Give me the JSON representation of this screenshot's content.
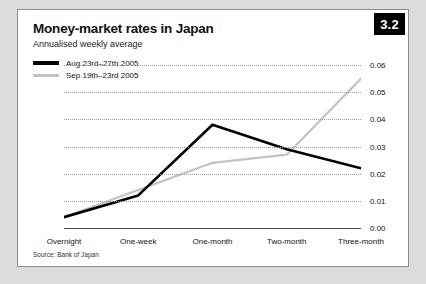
{
  "badge": {
    "label": "3.2"
  },
  "title": "Money-market rates in Japan",
  "subtitle": "Annualised weekly average",
  "source": "Source: Bank of Japan",
  "legend": [
    {
      "label": "Aug 23rd–27th 2005",
      "color": "#000000"
    },
    {
      "label": "Sep 19th–23rd 2005",
      "color": "#c2c2c2"
    }
  ],
  "chart_data": {
    "type": "line",
    "title": "Money-market rates in Japan",
    "subtitle": "Annualised weekly average",
    "xlabel": "",
    "ylabel": "",
    "categories": [
      "Overnight",
      "One-week",
      "One-month",
      "Two-month",
      "Three-month"
    ],
    "series": [
      {
        "name": "Aug 23rd–27th 2005",
        "color": "#000000",
        "values": [
          0.004,
          0.012,
          0.038,
          0.029,
          0.022
        ]
      },
      {
        "name": "Sep 19th–23rd 2005",
        "color": "#c2c2c2",
        "values": [
          0.004,
          0.014,
          0.024,
          0.027,
          0.055
        ]
      }
    ],
    "ylim": [
      0.0,
      0.06
    ],
    "yticks": [
      "0.00",
      "0.01",
      "0.02",
      "0.03",
      "0.04",
      "0.05",
      "0.06"
    ],
    "ytick_values": [
      0.0,
      0.01,
      0.02,
      0.03,
      0.04,
      0.05,
      0.06
    ],
    "grid": true,
    "grid_style": "dotted",
    "legend_position": "top-left",
    "source": "Source: Bank of Japan"
  }
}
